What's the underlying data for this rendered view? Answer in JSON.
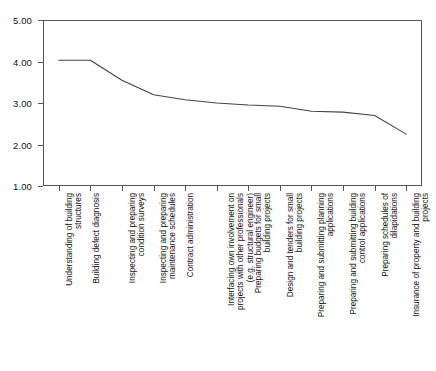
{
  "figure": {
    "clipped_header_text": "",
    "background_color": "#ffffff",
    "line_color": "#444444",
    "axis_color": "#555555"
  },
  "chart_data": {
    "type": "line",
    "title": "",
    "subtitle": "",
    "xlabel": "",
    "ylabel": "",
    "ylim": [
      1.0,
      5.0
    ],
    "grid": false,
    "legend": null,
    "y_tick_labels": [
      "5.00",
      "4.00",
      "3.00",
      "2.00",
      "1.00"
    ],
    "y_tick_values": [
      5.0,
      4.0,
      3.0,
      2.0,
      1.0
    ],
    "categories": [
      "Understanding of building structures",
      "Building defect diagnosis",
      "Inspecting and preparing condition surveys",
      "Inspecting and preparing maintenance schedules",
      "Contract administration",
      "Interfacing own involvement on projects with other professionals (e.g. structural engineer)",
      "Preparing budgets for small building projects",
      "Design and tenders for small building projects",
      "Preparing and submitting planning applications",
      "Preparing and submitting building control applications",
      "Preparing schedules of dilapidations",
      "Insurance of property and building projects"
    ],
    "category_lines": [
      [
        "Understanding of building",
        "structures"
      ],
      [
        "Building defect diagnosis"
      ],
      [
        "Inspecting and preparing",
        "condition surveys"
      ],
      [
        "Inspecting and preparing",
        "maintenance schedules"
      ],
      [
        "Contract administration"
      ],
      [
        "Interfacing own involvement on",
        "projects with other professionals",
        "(e.g. structural engineer)"
      ],
      [
        "Preparing budgets for small",
        "building projects"
      ],
      [
        "Design and tenders for small",
        "building projects"
      ],
      [
        "Preparing and submitting planning",
        "applications"
      ],
      [
        "Preparing and submitting building",
        "control applications"
      ],
      [
        "Preparing schedules of",
        "dilapidations"
      ],
      [
        "Insurance of property and building",
        "projects"
      ]
    ],
    "values": [
      4.03,
      4.03,
      3.55,
      3.2,
      3.08,
      3.0,
      2.95,
      2.92,
      2.8,
      2.78,
      2.7,
      2.25
    ],
    "series": [
      {
        "name": "",
        "values": [
          4.03,
          4.03,
          3.55,
          3.2,
          3.08,
          3.0,
          2.95,
          2.92,
          2.8,
          2.78,
          2.7,
          2.25
        ]
      }
    ]
  }
}
